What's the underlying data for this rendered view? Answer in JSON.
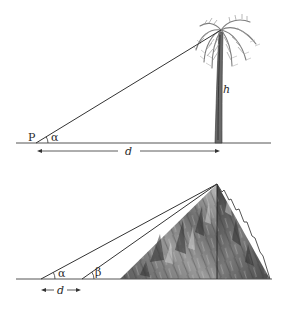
{
  "figure_top": {
    "description": "Measuring the height of a palm tree from point P at angle alpha and distance d",
    "labels": {
      "point": "P",
      "angle": "α",
      "distance": "d",
      "height": "h"
    }
  },
  "figure_bottom": {
    "description": "Measuring the height of a mountain from two points separated by distance d with angles alpha and beta",
    "labels": {
      "angle_1": "α",
      "angle_2": "β",
      "distance": "d"
    }
  },
  "colors": {
    "line": "#333333",
    "trunk": "#555555",
    "foliage": "#8a8a8a",
    "mountain_dark": "#3c3c3c",
    "mountain_light": "#b5b5b5"
  }
}
